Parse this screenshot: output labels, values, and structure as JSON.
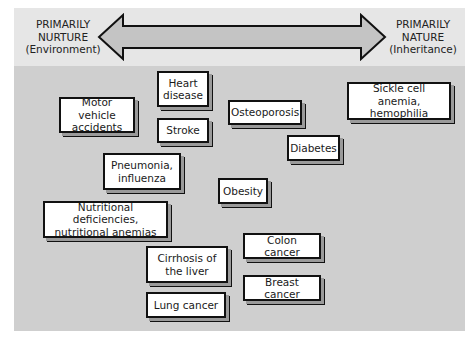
{
  "arrow": {
    "left": {
      "line1": "PRIMARILY",
      "line2": "NURTURE",
      "line3": "(Environment)"
    },
    "right": {
      "line1": "PRIMARILY",
      "line2": "NATURE",
      "line3": "(Inheritance)"
    }
  },
  "colors": {
    "top_band": "#e6e6e6",
    "main_panel": "#cfcfcf",
    "arrow_fill": "#c4c4c4",
    "box_border": "#111111"
  },
  "conditions": [
    {
      "id": "heart-disease",
      "lines": [
        "Heart",
        "disease"
      ]
    },
    {
      "id": "motor-vehicle-accidents",
      "lines": [
        "Motor vehicle",
        "accidents"
      ]
    },
    {
      "id": "stroke",
      "lines": [
        "Stroke"
      ]
    },
    {
      "id": "osteoporosis",
      "lines": [
        "Osteoporosis"
      ]
    },
    {
      "id": "sickle-cell",
      "lines": [
        "Sickle cell anemia,",
        "hemophilia"
      ]
    },
    {
      "id": "diabetes",
      "lines": [
        "Diabetes"
      ]
    },
    {
      "id": "pneumonia",
      "lines": [
        "Pneumonia,",
        "influenza"
      ]
    },
    {
      "id": "obesity",
      "lines": [
        "Obesity"
      ]
    },
    {
      "id": "nutritional",
      "lines": [
        "Nutritional deficiencies,",
        "nutritional anemias"
      ]
    },
    {
      "id": "colon-cancer",
      "lines": [
        "Colon cancer"
      ]
    },
    {
      "id": "cirrhosis",
      "lines": [
        "Cirrhosis of",
        "the liver"
      ]
    },
    {
      "id": "breast-cancer",
      "lines": [
        "Breast cancer"
      ]
    },
    {
      "id": "lung-cancer",
      "lines": [
        "Lung cancer"
      ]
    }
  ]
}
